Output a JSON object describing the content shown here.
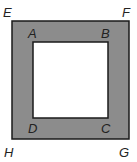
{
  "diagram": {
    "outer_square": {
      "vertices": [
        "E",
        "F",
        "G",
        "H"
      ],
      "fill": "#8c8c8c",
      "stroke": "#1a1a1a"
    },
    "inner_square": {
      "vertices": [
        "A",
        "B",
        "C",
        "D"
      ],
      "fill": "#ffffff",
      "stroke": "#1a1a1a"
    },
    "labels": {
      "E": "E",
      "F": "F",
      "G": "G",
      "H": "H",
      "A": "A",
      "B": "B",
      "C": "C",
      "D": "D"
    }
  }
}
